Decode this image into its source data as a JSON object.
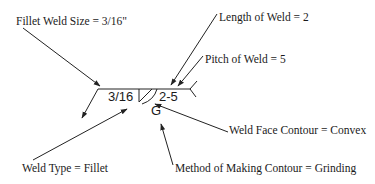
{
  "diagram": {
    "symbol": {
      "left_dimension": "3/16",
      "right_dimension": "2-5",
      "finish_letter": "G"
    },
    "callouts": {
      "fillet_weld_size": "Fillet Weld Size = 3/16\"",
      "length_of_weld": "Length of Weld = 2",
      "pitch_of_weld": "Pitch of Weld = 5",
      "weld_face_contour": "Weld Face Contour = Convex",
      "weld_type": "Weld Type = Fillet",
      "method_of_contour": "Method of Making Contour = Grinding"
    },
    "colors": {
      "line": "#222222",
      "text": "#1a1a1a",
      "background": "#ffffff"
    }
  }
}
